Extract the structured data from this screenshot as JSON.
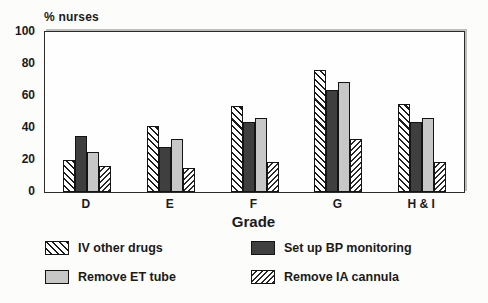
{
  "chart_data": {
    "type": "bar",
    "title": "",
    "ylabel": "% nurses",
    "xlabel": "Grade",
    "ylim": [
      0,
      100
    ],
    "yticks": [
      0,
      20,
      40,
      60,
      80,
      100
    ],
    "grid": false,
    "legend_position": "bottom",
    "categories": [
      "D",
      "E",
      "F",
      "G",
      "H & I"
    ],
    "series": [
      {
        "name": "IV other drugs",
        "style": "hatch-backslash",
        "values": [
          20,
          41,
          54,
          76,
          55
        ]
      },
      {
        "name": "Set up BP monitoring",
        "style": "solid-dark",
        "values": [
          35,
          28,
          44,
          64,
          44
        ]
      },
      {
        "name": "Remove ET tube",
        "style": "solid-light",
        "values": [
          25,
          33,
          46,
          69,
          46
        ]
      },
      {
        "name": "Remove IA cannula",
        "style": "hatch-slash",
        "values": [
          16,
          15,
          19,
          33,
          19
        ]
      }
    ],
    "colors": {
      "solid_dark": "#3f3f3f",
      "solid_light": "#c7c7c7",
      "hatch_line": "#1c1c1c",
      "frame": "#2b2b2b",
      "background": "#fcfcfb"
    }
  }
}
